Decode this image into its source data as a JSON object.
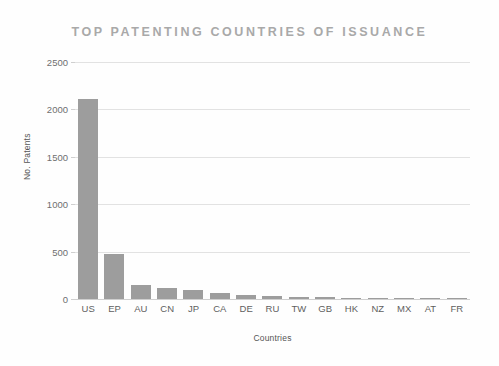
{
  "chart_data": {
    "type": "bar",
    "title": "TOP PATENTING COUNTRIES OF ISSUANCE",
    "xlabel": "Countries",
    "ylabel": "No. Patents",
    "categories": [
      "US",
      "EP",
      "AU",
      "CN",
      "JP",
      "CA",
      "DE",
      "RU",
      "TW",
      "GB",
      "HK",
      "NZ",
      "MX",
      "AT",
      "FR"
    ],
    "values": [
      2110,
      470,
      150,
      115,
      95,
      60,
      42,
      28,
      22,
      18,
      12,
      10,
      6,
      4,
      3
    ],
    "ylim": [
      0,
      2500
    ],
    "yticks": [
      0,
      500,
      1000,
      1500,
      2000,
      2500
    ],
    "ytick_labels": [
      "0",
      "500",
      "1000",
      "1500",
      "2000",
      "2500"
    ],
    "grid": true,
    "legend": "none",
    "bar_color": "#9d9d9d",
    "grid_color": "#e2e2e2",
    "title_color": "#a9a9a9",
    "background": "#fefefe"
  }
}
